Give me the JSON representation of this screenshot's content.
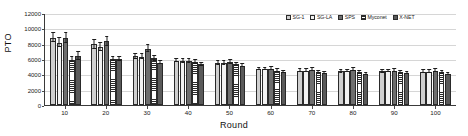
{
  "chart_data": {
    "type": "bar",
    "title": "",
    "xlabel": "Round",
    "ylabel": "PTO",
    "categories": [
      "10",
      "20",
      "30",
      "40",
      "50",
      "60",
      "70",
      "80",
      "90",
      "100"
    ],
    "ylim": [
      0,
      12000
    ],
    "yticks": [
      0,
      2000,
      4000,
      6000,
      8000,
      10000,
      12000
    ],
    "grid": true,
    "legend_position": "top-right",
    "series": [
      {
        "name": "SG-1",
        "values": [
          8800,
          7900,
          6350,
          5800,
          5450,
          4700,
          4500,
          4400,
          4400,
          4350
        ],
        "errors": [
          620,
          560,
          330,
          250,
          230,
          180,
          170,
          160,
          160,
          160
        ]
      },
      {
        "name": "SG-LA",
        "values": [
          8150,
          7600,
          6300,
          5750,
          5500,
          4700,
          4500,
          4400,
          4400,
          4350
        ],
        "errors": [
          560,
          520,
          320,
          240,
          220,
          175,
          165,
          155,
          155,
          155
        ]
      },
      {
        "name": "SPS",
        "values": [
          8750,
          8300,
          7350,
          5750,
          5600,
          4750,
          4600,
          4600,
          4500,
          4500
        ],
        "errors": [
          600,
          620,
          480,
          250,
          240,
          180,
          170,
          170,
          165,
          165
        ]
      },
      {
        "name": "Myconet",
        "values": [
          5900,
          6000,
          6100,
          5600,
          5300,
          4500,
          4350,
          4250,
          4250,
          4250
        ],
        "errors": [
          300,
          280,
          300,
          230,
          210,
          160,
          150,
          150,
          150,
          150
        ]
      },
      {
        "name": "X-NET",
        "values": [
          6400,
          6000,
          5500,
          5300,
          5100,
          4300,
          4150,
          4100,
          4150,
          4100
        ],
        "errors": [
          520,
          270,
          200,
          200,
          190,
          150,
          145,
          140,
          145,
          140
        ]
      }
    ]
  }
}
